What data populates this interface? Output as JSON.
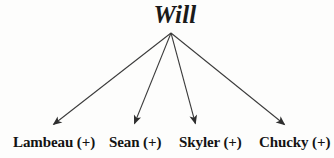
{
  "diagram": {
    "type": "tree",
    "root": {
      "label": "Will"
    },
    "origin": {
      "x": 171,
      "y": 33
    },
    "children": [
      {
        "name": "Lambeau",
        "sign": "(+)",
        "label": "Lambeau (+)",
        "arrow_end": {
          "x": 50,
          "y": 128
        }
      },
      {
        "name": "Sean",
        "sign": "(+)",
        "label": "Sean (+)",
        "arrow_end": {
          "x": 133,
          "y": 128
        }
      },
      {
        "name": "Skyler",
        "sign": "(+)",
        "label": "Skyler (+)",
        "arrow_end": {
          "x": 196,
          "y": 128
        }
      },
      {
        "name": "Chucky",
        "sign": "(+)",
        "label": "Chucky (+)",
        "arrow_end": {
          "x": 288,
          "y": 128
        }
      }
    ],
    "colors": {
      "background": "#fdfdfc",
      "text": "#161616",
      "line": "#3a3a3a"
    }
  }
}
